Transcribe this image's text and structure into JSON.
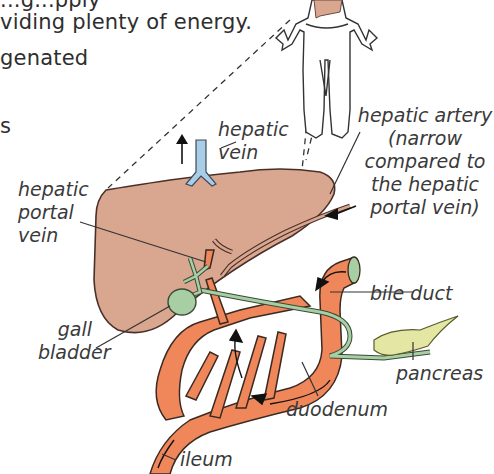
{
  "body_text": {
    "line1_partial": "...g...pply",
    "line2": "viding plenty of energy.",
    "line3": "genated",
    "line4": "s"
  },
  "labels": {
    "hepatic_vein": [
      "hepatic",
      "vein"
    ],
    "hepatic_artery": [
      "hepatic artery",
      "(narrow",
      "compared to",
      "the hepatic",
      "portal vein)"
    ],
    "hepatic_portal_vein": [
      "hepatic",
      "portal",
      "vein"
    ],
    "gall_bladder": [
      "gall",
      "bladder"
    ],
    "bile_duct": "bile duct",
    "pancreas": "pancreas",
    "duodenum": "duodenum",
    "ileum": "ileum"
  },
  "colors": {
    "liver": "#d9a68f",
    "liver_outline": "#4a3028",
    "intestine": "#f0875a",
    "intestine_outline": "#3a2a22",
    "bile_green": "#a8cfa4",
    "hepatic_vein_blue": "#a9cde6",
    "pancreas_yellow": "#e4e6a4",
    "body_outline": "#333333"
  }
}
